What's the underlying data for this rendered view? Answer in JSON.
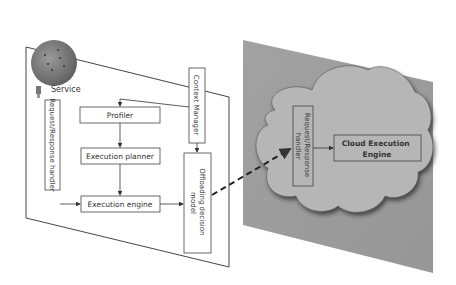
{
  "device": {
    "service_label": "Service",
    "request_response_handler": "Request/Response handler",
    "profiler": "Profiler",
    "execution_planner": "Execution planner",
    "execution_engine": "Execution engine",
    "context_manager": "Context Manager",
    "offloading_model_line1": "Offloading decision",
    "offloading_model_line2": "model"
  },
  "cloud": {
    "handler_line1": "Request/Response",
    "handler_line2": "handler",
    "engine_line1": "Cloud Execution",
    "engine_line2": "Engine"
  },
  "colors": {
    "panel_gray": "#9c9c9c",
    "cloud_fill": "#b4b4b4",
    "line": "#333333"
  }
}
